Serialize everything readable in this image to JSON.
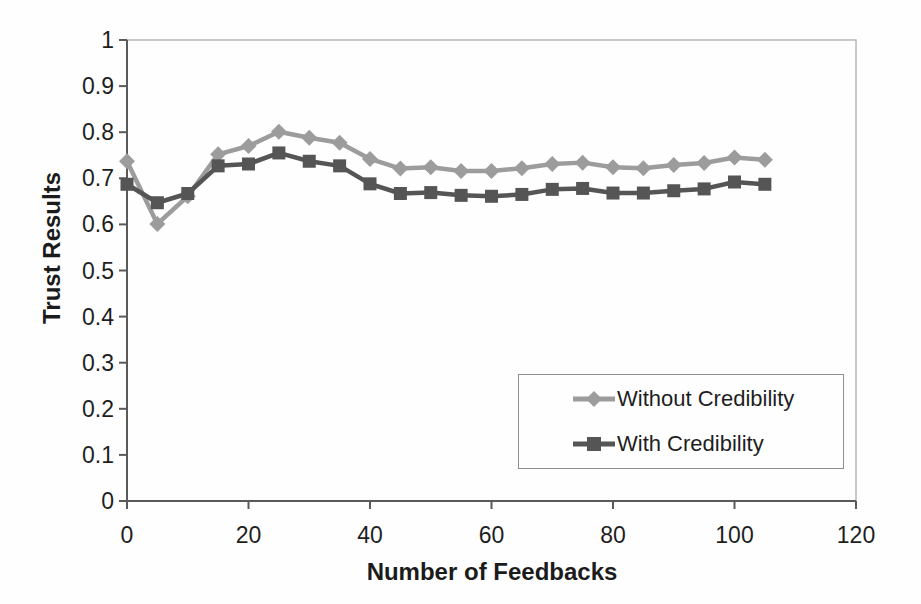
{
  "chart_data": {
    "type": "line",
    "title": "",
    "xlabel": "Number of Feedbacks",
    "ylabel": "Trust Results",
    "xlim": [
      0,
      120
    ],
    "ylim": [
      0,
      1
    ],
    "x_ticks": [
      0,
      20,
      40,
      60,
      80,
      100,
      120
    ],
    "y_ticks": [
      0,
      0.1,
      0.2,
      0.3,
      0.4,
      0.5,
      0.6,
      0.7,
      0.8,
      0.9,
      1
    ],
    "y_tick_labels": [
      "0",
      "0.1",
      "0.2",
      "0.3",
      "0.4",
      "0.5",
      "0.6",
      "0.7",
      "0.8",
      "0.9",
      "1"
    ],
    "grid": false,
    "legend_position": "inside-lower-right",
    "x": [
      0,
      5,
      10,
      15,
      20,
      25,
      30,
      35,
      40,
      45,
      50,
      55,
      60,
      65,
      70,
      75,
      80,
      85,
      90,
      95,
      100,
      105
    ],
    "series": [
      {
        "name": "Without Credibility",
        "marker": "diamond",
        "color": "#9c9c9c",
        "values": [
          0.737,
          0.601,
          0.661,
          0.752,
          0.77,
          0.801,
          0.788,
          0.777,
          0.742,
          0.721,
          0.724,
          0.716,
          0.716,
          0.722,
          0.731,
          0.734,
          0.724,
          0.722,
          0.729,
          0.733,
          0.745,
          0.74
        ]
      },
      {
        "name": "With Credibility",
        "marker": "square",
        "color": "#555555",
        "values": [
          0.687,
          0.647,
          0.667,
          0.727,
          0.731,
          0.755,
          0.737,
          0.727,
          0.688,
          0.667,
          0.669,
          0.663,
          0.661,
          0.665,
          0.676,
          0.678,
          0.668,
          0.668,
          0.673,
          0.677,
          0.692,
          0.687
        ]
      }
    ],
    "colors": {
      "axis_line": "#5a5a5a",
      "plot_border": "#b2b2b2",
      "text": "#1e1e1e"
    }
  }
}
